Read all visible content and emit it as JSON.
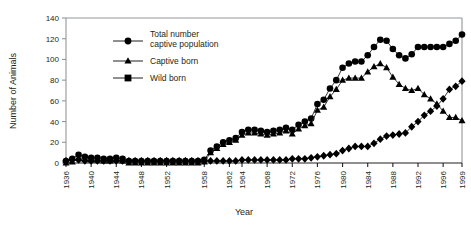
{
  "chart_data": {
    "type": "line",
    "title": "",
    "xlabel": "Year",
    "ylabel": "Number of Animals",
    "xlim": [
      1936,
      1999
    ],
    "ylim": [
      0,
      140
    ],
    "yticks": [
      0,
      20,
      40,
      60,
      80,
      100,
      120,
      140
    ],
    "xticks": [
      1936,
      1940,
      1944,
      1948,
      1952,
      1958,
      1962,
      1964,
      1968,
      1972,
      1976,
      1980,
      1984,
      1988,
      1992,
      1996,
      1999
    ],
    "grid": false,
    "legend_position": "upper-left-inside",
    "x": [
      1936,
      1937,
      1938,
      1939,
      1940,
      1941,
      1942,
      1943,
      1944,
      1945,
      1946,
      1947,
      1948,
      1949,
      1950,
      1951,
      1952,
      1953,
      1954,
      1955,
      1956,
      1957,
      1958,
      1959,
      1960,
      1961,
      1962,
      1963,
      1964,
      1965,
      1966,
      1967,
      1968,
      1969,
      1970,
      1971,
      1972,
      1973,
      1974,
      1975,
      1976,
      1977,
      1978,
      1979,
      1980,
      1981,
      1982,
      1983,
      1984,
      1985,
      1986,
      1987,
      1988,
      1989,
      1990,
      1991,
      1992,
      1993,
      1994,
      1995,
      1996,
      1997,
      1998,
      1999
    ],
    "series": [
      {
        "name": "Total number captive population",
        "marker": "circle",
        "color": "#000000",
        "values": [
          2,
          4,
          8,
          6,
          5,
          5,
          4,
          4,
          5,
          4,
          2,
          2,
          2,
          2,
          2,
          2,
          2,
          2,
          2,
          2,
          2,
          2,
          3,
          12,
          16,
          20,
          22,
          24,
          30,
          32,
          32,
          31,
          30,
          31,
          32,
          34,
          32,
          37,
          40,
          43,
          57,
          61,
          72,
          80,
          92,
          96,
          98,
          98,
          104,
          112,
          119,
          118,
          110,
          104,
          101,
          105,
          112,
          112,
          112,
          112,
          112,
          115,
          118,
          124
        ]
      },
      {
        "name": "Captive born",
        "marker": "triangle",
        "color": "#000000",
        "values": [
          0,
          1,
          5,
          4,
          3,
          3,
          2,
          2,
          3,
          2,
          0,
          0,
          0,
          0,
          0,
          0,
          0,
          0,
          0,
          0,
          0,
          0,
          1,
          10,
          14,
          18,
          20,
          22,
          27,
          29,
          29,
          28,
          27,
          28,
          29,
          31,
          28,
          33,
          36,
          38,
          51,
          54,
          64,
          71,
          80,
          82,
          82,
          82,
          88,
          93,
          96,
          92,
          83,
          76,
          72,
          70,
          72,
          66,
          62,
          57,
          50,
          44,
          44,
          41
        ]
      },
      {
        "name": "Wild born",
        "marker": "diamond",
        "color": "#000000",
        "values": [
          2,
          3,
          3,
          2,
          2,
          2,
          2,
          2,
          2,
          2,
          2,
          2,
          2,
          2,
          2,
          2,
          2,
          2,
          2,
          2,
          2,
          2,
          2,
          2,
          2,
          2,
          2,
          2,
          3,
          3,
          3,
          3,
          3,
          3,
          3,
          3,
          4,
          4,
          4,
          5,
          6,
          7,
          8,
          9,
          12,
          14,
          16,
          16,
          16,
          19,
          23,
          26,
          27,
          28,
          29,
          35,
          40,
          46,
          50,
          55,
          62,
          71,
          74,
          79
        ]
      }
    ]
  },
  "legend": {
    "entries": [
      {
        "label_line1": "Total number",
        "label_line2": "captive population",
        "marker": "circle"
      },
      {
        "label_line1": "Captive born",
        "label_line2": "",
        "marker": "triangle"
      },
      {
        "label_line1": "Wild born",
        "label_line2": "",
        "marker": "square"
      }
    ]
  },
  "icons": {
    "circle_marker": "circle-marker-icon",
    "triangle_marker": "triangle-marker-icon",
    "square_marker": "square-marker-icon",
    "diamond_marker": "diamond-marker-icon"
  }
}
